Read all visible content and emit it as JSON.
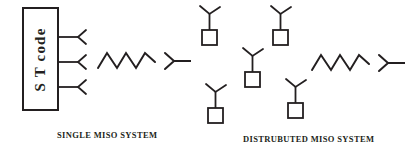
{
  "figure": {
    "width": 419,
    "height": 153,
    "background_color": "#ffffff",
    "stroke_color": "#231f20",
    "text_color": "#231f20"
  },
  "left_panel": {
    "caption": "SINGLE MISO SYSTEM",
    "encoder_box": {
      "label": "S T code",
      "x": 23,
      "y": 8,
      "width": 35,
      "height": 102
    },
    "transmit_antennas": [
      {
        "stem_y": 37
      },
      {
        "stem_y": 62
      },
      {
        "stem_y": 87
      }
    ],
    "wave": {
      "peaks": 3,
      "x": 98,
      "y": 60,
      "width": 57,
      "amplitude": 8
    },
    "receive_antenna": {
      "x": 165,
      "y": 60,
      "tail_length": 16
    }
  },
  "right_panel": {
    "caption": "DISTRUBUTED MISO SYSTEM",
    "distributed_nodes": [
      {
        "id": "node-1",
        "box_x": 202,
        "box_y": 30,
        "box_size": 15
      },
      {
        "id": "node-2",
        "box_x": 273,
        "box_y": 30,
        "box_size": 15
      },
      {
        "id": "node-3",
        "box_x": 245,
        "box_y": 72,
        "box_size": 15
      },
      {
        "id": "node-4",
        "box_x": 208,
        "box_y": 108,
        "box_size": 15
      },
      {
        "id": "node-5",
        "box_x": 288,
        "box_y": 103,
        "box_size": 15
      }
    ],
    "wave": {
      "peaks": 3,
      "x": 312,
      "y": 62,
      "width": 57,
      "amplitude": 8
    },
    "receive_antenna": {
      "x": 379,
      "y": 62,
      "tail_length": 16
    }
  }
}
